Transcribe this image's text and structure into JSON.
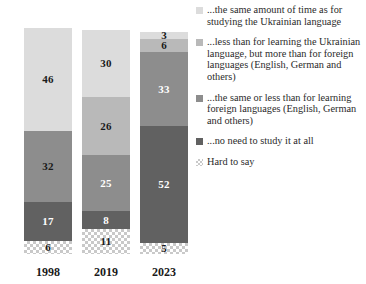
{
  "chart_data": {
    "type": "bar",
    "subtype": "stacked-bar-100",
    "title": "",
    "subtitle": "",
    "xlabel": "",
    "ylabel": "",
    "ylim": [
      0,
      100
    ],
    "grid": false,
    "legend_position": "right",
    "orientation": "vertical",
    "stack_order": "top-to-bottom",
    "categories": [
      "1998",
      "2019",
      "2023"
    ],
    "series": [
      {
        "name": "...the same amount of time as for studying the Ukrainian language",
        "color": "#dcdcdc",
        "label_color": "#1a1a1a",
        "values": [
          46,
          30,
          3
        ]
      },
      {
        "name": "...less than for learning the Ukrainian language, but more than for foreign languages (English, German and others)",
        "color": "#b9b9b9",
        "label_color": "#1a1a1a",
        "values": [
          0,
          26,
          6
        ]
      },
      {
        "name": "...the same or less than for learning foreign languages (English, German and others)",
        "color": "#8d8d8d",
        "label_color": "#1a1a1a",
        "values": [
          32,
          25,
          33
        ]
      },
      {
        "name": "...no need to study it at all",
        "color": "#616161",
        "label_color": "#ffffff",
        "values": [
          17,
          8,
          52
        ]
      },
      {
        "name": "Hard to say",
        "color": "hatch",
        "label_color": "#1a1a1a",
        "values": [
          6,
          11,
          5
        ]
      }
    ]
  },
  "bars": [
    {
      "year": "1998",
      "segments": [
        {
          "value": "46",
          "pct": 46,
          "color": "#dcdcdc",
          "text_color": "#1a1a1a",
          "show_label": true,
          "label_outside": false,
          "pattern": "solid"
        },
        {
          "value": "",
          "pct": 0,
          "color": "#b9b9b9",
          "text_color": "#1a1a1a",
          "show_label": false,
          "label_outside": false,
          "pattern": "solid"
        },
        {
          "value": "32",
          "pct": 32,
          "color": "#8d8d8d",
          "text_color": "#1a1a1a",
          "show_label": true,
          "label_outside": false,
          "pattern": "solid"
        },
        {
          "value": "17",
          "pct": 17,
          "color": "#616161",
          "text_color": "#ffffff",
          "show_label": true,
          "label_outside": false,
          "pattern": "solid"
        },
        {
          "value": "6",
          "pct": 6,
          "color": "hatch",
          "text_color": "#1a1a1a",
          "show_label": true,
          "label_outside": false,
          "pattern": "hatch"
        }
      ]
    },
    {
      "year": "2019",
      "segments": [
        {
          "value": "30",
          "pct": 30,
          "color": "#dcdcdc",
          "text_color": "#1a1a1a",
          "show_label": true,
          "label_outside": false,
          "pattern": "solid"
        },
        {
          "value": "26",
          "pct": 26,
          "color": "#b9b9b9",
          "text_color": "#1a1a1a",
          "show_label": true,
          "label_outside": false,
          "pattern": "solid"
        },
        {
          "value": "25",
          "pct": 25,
          "color": "#8d8d8d",
          "text_color": "#ffffff",
          "show_label": true,
          "label_outside": false,
          "pattern": "solid"
        },
        {
          "value": "8",
          "pct": 8,
          "color": "#616161",
          "text_color": "#ffffff",
          "show_label": true,
          "label_outside": false,
          "pattern": "solid"
        },
        {
          "value": "11",
          "pct": 11,
          "color": "hatch",
          "text_color": "#1a1a1a",
          "show_label": true,
          "label_outside": false,
          "pattern": "hatch"
        }
      ]
    },
    {
      "year": "2023",
      "segments": [
        {
          "value": "3",
          "pct": 3,
          "color": "#dcdcdc",
          "text_color": "#1a1a1a",
          "show_label": true,
          "label_outside": false,
          "pattern": "solid"
        },
        {
          "value": "6",
          "pct": 6,
          "color": "#b9b9b9",
          "text_color": "#1a1a1a",
          "show_label": true,
          "label_outside": false,
          "pattern": "solid"
        },
        {
          "value": "33",
          "pct": 33,
          "color": "#8d8d8d",
          "text_color": "#ffffff",
          "show_label": true,
          "label_outside": false,
          "pattern": "solid"
        },
        {
          "value": "52",
          "pct": 52,
          "color": "#616161",
          "text_color": "#ffffff",
          "show_label": true,
          "label_outside": false,
          "pattern": "solid"
        },
        {
          "value": "5",
          "pct": 5,
          "color": "hatch",
          "text_color": "#1a1a1a",
          "show_label": true,
          "label_outside": false,
          "pattern": "hatch"
        }
      ]
    }
  ],
  "legend": {
    "items": [
      {
        "label": "...the same amount of time as for studying the Ukrainian language",
        "color": "#dcdcdc",
        "pattern": "solid"
      },
      {
        "label": "...less than for learning the Ukrainian language, but more than for foreign languages (English, German and others)",
        "color": "#b9b9b9",
        "pattern": "solid"
      },
      {
        "label": "...the same or less than for learning foreign languages (English, German and others)",
        "color": "#8d8d8d",
        "pattern": "solid"
      },
      {
        "label": "...no need to study it at all",
        "color": "#616161",
        "pattern": "solid"
      },
      {
        "label": "Hard to say",
        "color": "hatch",
        "pattern": "hatch"
      }
    ]
  },
  "axis": {
    "category_labels": [
      "1998",
      "2019",
      "2023"
    ]
  },
  "colors": {
    "segment_1": "#dcdcdc",
    "segment_2": "#b9b9b9",
    "segment_3": "#8d8d8d",
    "segment_4": "#616161",
    "hatch_line": "#c9c9c9",
    "background": "#ffffff",
    "text": "#2b2b2b"
  }
}
